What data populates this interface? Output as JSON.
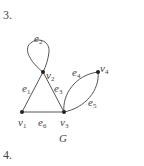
{
  "problems": [
    {
      "number": "3.",
      "graph_name": "G"
    },
    {
      "number": "4."
    }
  ],
  "graph": {
    "name": "G",
    "vertices": [
      {
        "id": "v1",
        "label": "v",
        "sub": "1",
        "x": 22,
        "y": 112
      },
      {
        "id": "v2",
        "label": "v",
        "sub": "2",
        "x": 43,
        "y": 72
      },
      {
        "id": "v3",
        "label": "v",
        "sub": "3",
        "x": 64,
        "y": 112
      },
      {
        "id": "v4",
        "label": "v",
        "sub": "4",
        "x": 98,
        "y": 72
      }
    ],
    "edges": [
      {
        "id": "e1",
        "label": "e",
        "sub": "1",
        "from": "v1",
        "to": "v2"
      },
      {
        "id": "e2",
        "label": "e",
        "sub": "2",
        "from": "v2",
        "to": "v2",
        "type": "loop"
      },
      {
        "id": "e3",
        "label": "e",
        "sub": "3",
        "from": "v2",
        "to": "v3"
      },
      {
        "id": "e4",
        "label": "e",
        "sub": "4",
        "from": "v3",
        "to": "v4",
        "type": "curve-upper"
      },
      {
        "id": "e5",
        "label": "e",
        "sub": "5",
        "from": "v3",
        "to": "v4",
        "type": "curve-lower"
      },
      {
        "id": "e6",
        "label": "e",
        "sub": "6",
        "from": "v1",
        "to": "v3"
      }
    ]
  }
}
